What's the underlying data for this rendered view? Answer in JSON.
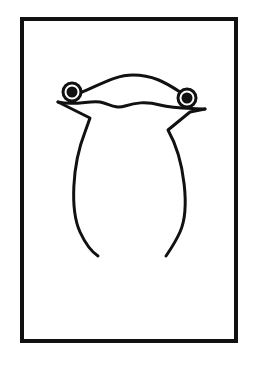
{
  "figure": {
    "colors": {
      "stroke": "#111111",
      "background": "#ffffff"
    }
  }
}
